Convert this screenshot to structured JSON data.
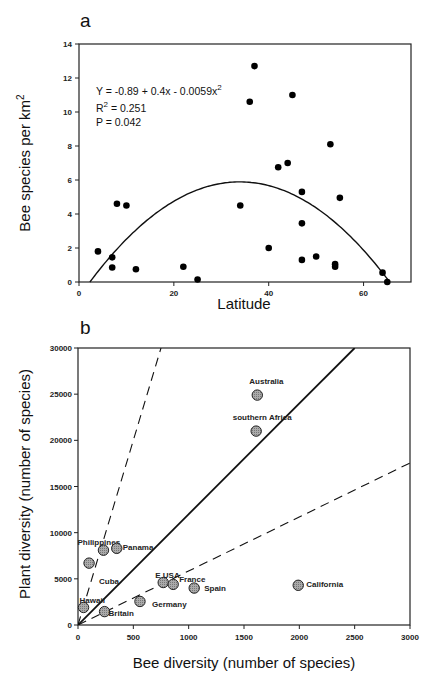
{
  "chart_data": [
    {
      "panel": "a",
      "type": "scatter",
      "xlabel": "Latitude",
      "ylabel": "Bee species per km²",
      "xlim": [
        0,
        70
      ],
      "ylim": [
        0,
        14
      ],
      "xticks": [
        "0",
        "20",
        "40",
        "60"
      ],
      "yticks": [
        "0",
        "2",
        "4",
        "6",
        "8",
        "10",
        "12",
        "14"
      ],
      "grid": false,
      "annotation": {
        "equation": "Y = -0.89 + 0.4x - 0.0059x",
        "equation_sup": "2",
        "r2_label": "R",
        "r2_sup": "2",
        "r2_value": " = 0.251",
        "p": "P = 0.042"
      },
      "fit": {
        "type": "quadratic",
        "a": -0.89,
        "b": 0.4,
        "c": -0.0059
      },
      "points": [
        {
          "x": 4,
          "y": 1.8
        },
        {
          "x": 7,
          "y": 1.45
        },
        {
          "x": 7,
          "y": 0.85
        },
        {
          "x": 8,
          "y": 4.6
        },
        {
          "x": 10,
          "y": 4.5
        },
        {
          "x": 12,
          "y": 0.75
        },
        {
          "x": 22,
          "y": 0.9
        },
        {
          "x": 25,
          "y": 0.15
        },
        {
          "x": 34,
          "y": 4.5
        },
        {
          "x": 36,
          "y": 10.6
        },
        {
          "x": 37,
          "y": 12.7
        },
        {
          "x": 40,
          "y": 2.0
        },
        {
          "x": 42,
          "y": 6.75
        },
        {
          "x": 44,
          "y": 7.0
        },
        {
          "x": 45,
          "y": 11.0
        },
        {
          "x": 47,
          "y": 5.3
        },
        {
          "x": 47,
          "y": 3.45
        },
        {
          "x": 47,
          "y": 1.3
        },
        {
          "x": 50,
          "y": 1.5
        },
        {
          "x": 53,
          "y": 8.1
        },
        {
          "x": 54,
          "y": 1.05
        },
        {
          "x": 54,
          "y": 0.9
        },
        {
          "x": 55,
          "y": 4.95
        },
        {
          "x": 64,
          "y": 0.55
        },
        {
          "x": 65,
          "y": 0.0
        }
      ]
    },
    {
      "panel": "b",
      "type": "scatter",
      "xlabel": "Bee diversity (number of species)",
      "ylabel": "Plant diversity (number of species)",
      "xlim": [
        0,
        3000
      ],
      "ylim": [
        0,
        30000
      ],
      "xticks": [
        "0",
        "500",
        "1000",
        "1500",
        "2000",
        "2500",
        "3000"
      ],
      "yticks": [
        "0",
        "5000",
        "10000",
        "15000",
        "20000",
        "25000",
        "30000"
      ],
      "grid": false,
      "lines": [
        {
          "style": "solid",
          "slope": 12
        },
        {
          "style": "dashed",
          "slope": 40
        },
        {
          "style": "dashed",
          "slope": 5.85
        }
      ],
      "points": [
        {
          "label": "Australia",
          "x": 1620,
          "y": 24900
        },
        {
          "label": "southern Africa",
          "x": 1610,
          "y": 21000
        },
        {
          "label": "Philippines",
          "x": 230,
          "y": 8100
        },
        {
          "label": "Panama",
          "x": 350,
          "y": 8300
        },
        {
          "label": "Cuba",
          "x": 100,
          "y": 6700
        },
        {
          "label": "Hawaii",
          "x": 50,
          "y": 1900
        },
        {
          "label": "Britain",
          "x": 240,
          "y": 1450
        },
        {
          "label": "Germany",
          "x": 560,
          "y": 2550
        },
        {
          "label": "E USA",
          "x": 770,
          "y": 4600
        },
        {
          "label": "France",
          "x": 860,
          "y": 4400
        },
        {
          "label": "Spain",
          "x": 1050,
          "y": 4000
        },
        {
          "label": "California",
          "x": 1990,
          "y": 4300
        }
      ]
    }
  ]
}
